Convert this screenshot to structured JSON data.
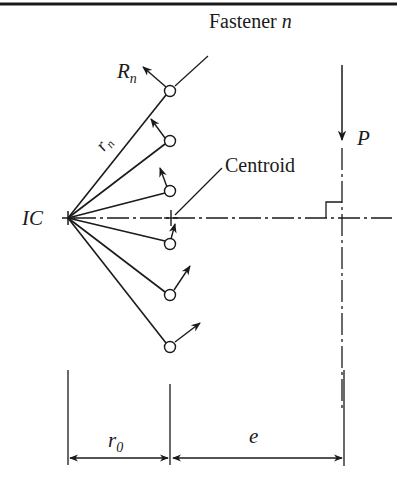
{
  "labels": {
    "force_name": "R",
    "force_sub": "n",
    "fastener_text": "Fastener ",
    "fastener_var": "n",
    "radius_name": "r",
    "radius_sub": "n",
    "centroid": "Centroid",
    "ic": "IC",
    "load": "P",
    "r0_name": "r",
    "r0_sub": "0",
    "eccentricity": "e"
  },
  "colors": {
    "line": "#1a1a1a",
    "background": "#ffffff"
  }
}
